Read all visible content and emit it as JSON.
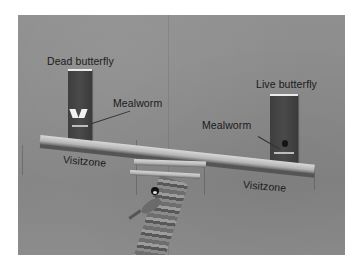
{
  "figure": {
    "colors": {
      "background": "#ffffff",
      "wall": "#8a8a8a",
      "panel": "#434343",
      "bar": "#c8c8c8",
      "label_text": "#1a1a1a"
    },
    "labels": {
      "dead_butterfly": "Dead butterfly",
      "live_butterfly": "Live butterfly",
      "mealworm_left": "Mealworm",
      "mealworm_right": "Mealworm",
      "visitzone_left": "Visitzone",
      "visitzone_right": "Visitzone"
    }
  }
}
